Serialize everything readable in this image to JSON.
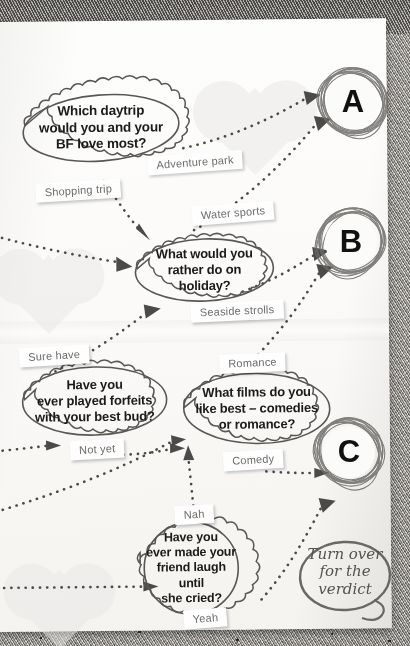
{
  "page": {
    "paper_color": "#fbfaf8",
    "ink_color": "#4c4a48"
  },
  "questions": [
    {
      "id": "q1",
      "text": "Which daytrip\nwould you and your\nBF love most?"
    },
    {
      "id": "q2",
      "text": "What would you\nrather do on\nholiday?"
    },
    {
      "id": "q3",
      "text": "Have you\never played forfeits\nwith your best bud?"
    },
    {
      "id": "q4",
      "text": "What films do you\nlike best – comedies\nor romance?"
    },
    {
      "id": "q5",
      "text": "Have you\never made your\nfriend laugh until\nshe cried?"
    }
  ],
  "answers": [
    {
      "id": "a1",
      "label": "Adventure park"
    },
    {
      "id": "a2",
      "label": "Shopping trip"
    },
    {
      "id": "a3",
      "label": "Water sports"
    },
    {
      "id": "a4",
      "label": "Seaside strolls"
    },
    {
      "id": "a5",
      "label": "Sure have"
    },
    {
      "id": "a6",
      "label": "Not yet"
    },
    {
      "id": "a7",
      "label": "Romance"
    },
    {
      "id": "a8",
      "label": "Comedy"
    },
    {
      "id": "a9",
      "label": "Nah"
    },
    {
      "id": "a10",
      "label": "Yeah"
    }
  ],
  "results": [
    {
      "id": "rA",
      "letter": "A"
    },
    {
      "id": "rB",
      "letter": "B"
    },
    {
      "id": "rC",
      "letter": "C"
    }
  ],
  "footer": {
    "turn_over_note": "Turn over\nfor the\nverdict"
  }
}
